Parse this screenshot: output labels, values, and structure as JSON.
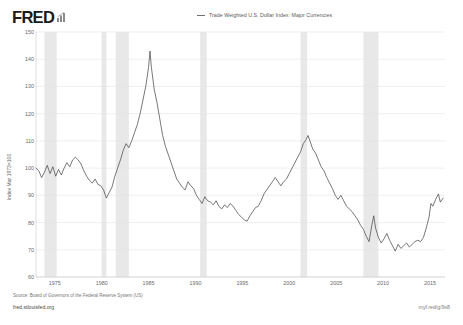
{
  "brand": {
    "logo_text": "FRED",
    "logo_icon": "bar-chart-icon"
  },
  "legend": {
    "entries": [
      {
        "label": "Trade Weighted U.S. Dollar Index: Major Currencies",
        "color": "#6e6e6e",
        "marker": "line-dash"
      }
    ]
  },
  "footer": {
    "source": "Source: Board of Governors of the Federal Reserve System (US)",
    "site": "fred.stlouisfed.org",
    "short_url": "myf.red/g/9x8"
  },
  "chart_data": {
    "type": "line",
    "title": "",
    "subtitle": "",
    "xlabel": "",
    "ylabel": "Index Mar 1973=100",
    "legend_position": "top-center",
    "grid": true,
    "xlim": [
      1973.0,
      2016.6
    ],
    "ylim": [
      60,
      150
    ],
    "yticks": [
      60,
      70,
      80,
      90,
      100,
      110,
      120,
      130,
      140,
      150
    ],
    "xticks": [
      1975,
      1980,
      1985,
      1990,
      1995,
      2000,
      2005,
      2010,
      2015
    ],
    "xtick_labels": [
      "1975",
      "1980",
      "1985",
      "1990",
      "1995",
      "2000",
      "2005",
      "2010",
      "2015"
    ],
    "ytick_labels": [
      "60",
      "70",
      "80",
      "90",
      "100",
      "110",
      "120",
      "130",
      "140",
      "150"
    ],
    "line_color": "#4b4b4b",
    "recession_band_color": "#e8e8e8",
    "recession_bands": [
      [
        1973.9,
        1975.2
      ],
      [
        1980.0,
        1980.5
      ],
      [
        1981.5,
        1982.9
      ],
      [
        1990.5,
        1991.2
      ],
      [
        2001.2,
        2001.9
      ],
      [
        2007.9,
        2009.5
      ]
    ],
    "series": [
      {
        "name": "Trade Weighted U.S. Dollar Index: Major Currencies",
        "x": [
          1973.0,
          1973.3,
          1973.6,
          1973.9,
          1974.2,
          1974.5,
          1974.8,
          1975.1,
          1975.4,
          1975.7,
          1976.0,
          1976.3,
          1976.6,
          1976.9,
          1977.2,
          1977.5,
          1977.8,
          1978.1,
          1978.4,
          1978.7,
          1979.0,
          1979.3,
          1979.6,
          1979.9,
          1980.2,
          1980.5,
          1980.8,
          1981.1,
          1981.4,
          1981.7,
          1982.0,
          1982.3,
          1982.6,
          1982.9,
          1983.2,
          1983.5,
          1983.8,
          1984.1,
          1984.4,
          1984.7,
          1985.0,
          1985.15,
          1985.3,
          1985.6,
          1985.9,
          1986.2,
          1986.5,
          1986.8,
          1987.1,
          1987.4,
          1987.7,
          1988.0,
          1988.3,
          1988.6,
          1988.9,
          1989.2,
          1989.5,
          1989.8,
          1990.1,
          1990.4,
          1990.7,
          1991.0,
          1991.3,
          1991.6,
          1991.9,
          1992.2,
          1992.5,
          1992.8,
          1993.1,
          1993.4,
          1993.7,
          1994.0,
          1994.3,
          1994.6,
          1994.9,
          1995.2,
          1995.5,
          1995.8,
          1996.1,
          1996.4,
          1996.7,
          1997.0,
          1997.3,
          1997.6,
          1997.9,
          1998.2,
          1998.5,
          1998.8,
          1999.1,
          1999.4,
          1999.7,
          2000.0,
          2000.3,
          2000.6,
          2000.9,
          2001.2,
          2001.5,
          2001.8,
          2002.0,
          2002.2,
          2002.5,
          2002.8,
          2003.1,
          2003.4,
          2003.7,
          2004.0,
          2004.3,
          2004.6,
          2004.9,
          2005.2,
          2005.5,
          2005.8,
          2006.1,
          2006.4,
          2006.7,
          2007.0,
          2007.3,
          2007.6,
          2007.9,
          2008.2,
          2008.5,
          2008.8,
          2009.0,
          2009.2,
          2009.5,
          2009.8,
          2010.1,
          2010.4,
          2010.7,
          2011.0,
          2011.3,
          2011.6,
          2011.9,
          2012.2,
          2012.5,
          2012.8,
          2013.1,
          2013.4,
          2013.7,
          2014.0,
          2014.3,
          2014.6,
          2014.9,
          2015.1,
          2015.3,
          2015.6,
          2015.9,
          2016.1,
          2016.4
        ],
        "y": [
          100.0,
          99.0,
          96.5,
          98.5,
          101.0,
          98.0,
          100.5,
          97.0,
          99.5,
          97.5,
          100.0,
          102.0,
          100.5,
          103.0,
          104.0,
          103.0,
          101.5,
          99.0,
          97.0,
          95.5,
          94.5,
          96.0,
          94.0,
          93.5,
          92.0,
          89.0,
          91.0,
          93.0,
          97.0,
          100.0,
          103.0,
          106.5,
          109.0,
          107.5,
          110.0,
          113.0,
          116.0,
          120.0,
          125.0,
          130.0,
          137.0,
          143.0,
          137.0,
          129.0,
          124.0,
          118.0,
          112.0,
          108.0,
          105.0,
          102.0,
          99.0,
          96.0,
          94.5,
          93.0,
          92.0,
          95.0,
          93.5,
          92.5,
          90.0,
          88.5,
          87.0,
          89.5,
          88.0,
          87.5,
          86.5,
          88.0,
          86.0,
          85.0,
          86.5,
          85.5,
          87.0,
          86.0,
          84.5,
          83.0,
          82.0,
          81.0,
          80.5,
          82.5,
          84.0,
          85.5,
          86.0,
          88.0,
          90.5,
          92.0,
          93.5,
          95.0,
          96.5,
          95.0,
          93.5,
          95.0,
          96.0,
          98.0,
          100.0,
          102.0,
          104.0,
          106.0,
          109.0,
          110.5,
          112.0,
          110.0,
          107.0,
          105.5,
          103.0,
          100.5,
          99.0,
          96.5,
          94.5,
          92.5,
          90.0,
          88.5,
          90.0,
          88.0,
          86.0,
          85.0,
          84.0,
          82.5,
          81.0,
          79.0,
          77.5,
          75.0,
          73.0,
          79.0,
          82.5,
          78.0,
          74.5,
          72.5,
          74.0,
          76.0,
          73.5,
          71.5,
          69.5,
          72.0,
          70.5,
          71.5,
          72.5,
          71.0,
          72.0,
          73.0,
          73.5,
          73.0,
          74.5,
          78.0,
          82.0,
          87.0,
          86.0,
          88.5,
          90.5,
          87.5,
          89.0
        ]
      }
    ]
  }
}
